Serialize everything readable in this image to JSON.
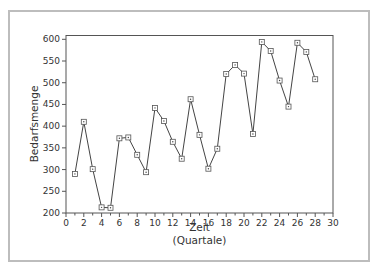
{
  "chart_data": {
    "type": "line",
    "title": "",
    "xlabel": "Zeit",
    "xlabel_sub": "(Quartale)",
    "ylabel": "Bedarfsmenge",
    "xlim": [
      0,
      30
    ],
    "ylim": [
      200,
      610
    ],
    "xticks": [
      0,
      2,
      4,
      6,
      8,
      10,
      12,
      14,
      16,
      18,
      20,
      22,
      24,
      26,
      28,
      30
    ],
    "yticks": [
      200,
      250,
      300,
      350,
      400,
      450,
      500,
      550,
      600
    ],
    "grid": false,
    "legend": null,
    "marker": "square",
    "x": [
      1,
      2,
      3,
      4,
      5,
      6,
      7,
      8,
      9,
      10,
      11,
      12,
      13,
      14,
      15,
      16,
      17,
      18,
      19,
      20,
      21,
      22,
      23,
      24,
      25,
      26,
      27,
      28
    ],
    "series": [
      {
        "name": "Bedarfsmenge",
        "values": [
          290,
          410,
          301,
          213,
          212,
          372,
          374,
          334,
          294,
          442,
          412,
          364,
          325,
          462,
          380,
          302,
          348,
          520,
          541,
          521,
          382,
          594,
          573,
          505,
          445,
          592,
          571,
          508
        ]
      }
    ]
  },
  "colors": {
    "line": "#444444",
    "marker_stroke": "#555555",
    "axis": "#555555",
    "frame": "#bdbdbd"
  }
}
